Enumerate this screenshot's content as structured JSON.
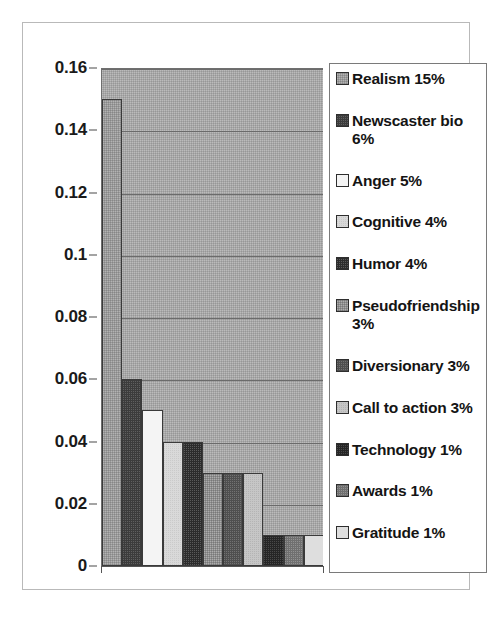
{
  "chart_data": {
    "type": "bar",
    "title": "",
    "xlabel": "",
    "ylabel": "",
    "ylim": [
      0,
      0.16
    ],
    "grid": true,
    "legend_position": "right",
    "ytick_labels": [
      "0.16",
      "0.14",
      "0.12",
      "0.1",
      "0.08",
      "0.06",
      "0.04",
      "0.02",
      "0"
    ],
    "ytick_values": [
      0.16,
      0.14,
      0.12,
      0.1,
      0.08,
      0.06,
      0.04,
      0.02,
      0
    ],
    "categories": [
      "Realism",
      "Newscaster bio",
      "Anger",
      "Cognitive",
      "Humor",
      "Pseudofriendship",
      "Diversionary",
      "Call to action",
      "Technology",
      "Awards",
      "Gratitude"
    ],
    "values": [
      0.15,
      0.06,
      0.05,
      0.04,
      0.04,
      0.03,
      0.03,
      0.03,
      0.01,
      0.01,
      0.01
    ],
    "percent_labels": [
      "15%",
      "6%",
      "5%",
      "4%",
      "4%",
      "3%",
      "3%",
      "3%",
      "1%",
      "1%",
      "1%"
    ],
    "bar_fills": [
      "fill-midgray",
      "fill-dark",
      "fill-white",
      "fill-lightgray",
      "fill-verydark",
      "fill-gray2",
      "fill-darkgray",
      "fill-litegray2",
      "fill-near-black",
      "fill-gray3",
      "fill-lightest"
    ],
    "colors": {
      "plot_background": "#a8a8a8",
      "gridline": "#6b6b6b",
      "axis": "#555555",
      "text": "#141414",
      "frame_border": "#b9b9b9",
      "legend_border": "#7a7a7a"
    }
  },
  "legend": {
    "entries": [
      {
        "label": "Realism 15%",
        "swatch": "fill-midgray"
      },
      {
        "label": "Newscaster bio 6%",
        "swatch": "fill-dark"
      },
      {
        "label": "Anger 5%",
        "swatch": "fill-white"
      },
      {
        "label": "Cognitive 4%",
        "swatch": "fill-lightgray"
      },
      {
        "label": "Humor 4%",
        "swatch": "fill-verydark"
      },
      {
        "label": "Pseudofriendship 3%",
        "swatch": "fill-gray2"
      },
      {
        "label": "Diversionary 3%",
        "swatch": "fill-darkgray"
      },
      {
        "label": "Call to action 3%",
        "swatch": "fill-litegray2"
      },
      {
        "label": "Technology 1%",
        "swatch": "fill-near-black"
      },
      {
        "label": "Awards 1%",
        "swatch": "fill-gray3"
      },
      {
        "label": "Gratitude 1%",
        "swatch": "fill-lightest"
      }
    ]
  }
}
